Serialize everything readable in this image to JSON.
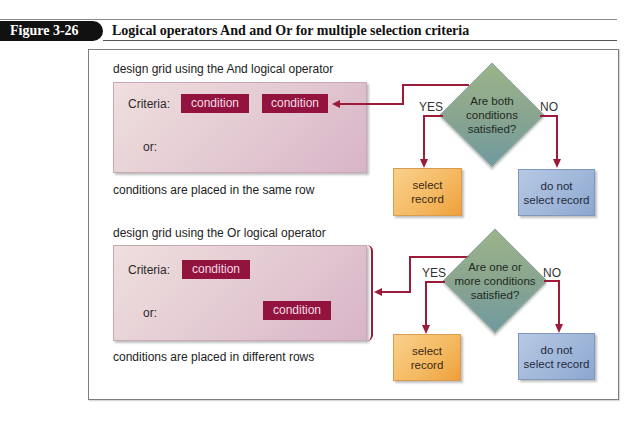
{
  "header": {
    "figure_label": "Figure 3-26",
    "title": "Logical operators And and Or for multiple selection criteria"
  },
  "and_section": {
    "caption_top": "design grid using the And logical operator",
    "criteria_label": "Criteria:",
    "or_label": "or:",
    "conditions": [
      "condition",
      "condition"
    ],
    "caption_bottom": "conditions are placed in the same row",
    "decision": "Are both conditions satisfied?",
    "decision_lines": [
      "Are both",
      "conditions",
      "satisfied?"
    ],
    "yes_label": "YES",
    "no_label": "NO",
    "yes_outcome_lines": [
      "select",
      "record"
    ],
    "no_outcome_lines": [
      "do not",
      "select record"
    ]
  },
  "or_section": {
    "caption_top": "design grid using the Or logical operator",
    "criteria_label": "Criteria:",
    "or_label": "or:",
    "conditions": [
      "condition",
      "condition"
    ],
    "caption_bottom": "conditions are placed in different rows",
    "decision": "Are one or more conditions satisfied?",
    "decision_lines": [
      "Are one or",
      "more conditions",
      "satisfied?"
    ],
    "yes_label": "YES",
    "no_label": "NO",
    "yes_outcome_lines": [
      "select",
      "record"
    ],
    "no_outcome_lines": [
      "do not",
      "select record"
    ]
  },
  "colors": {
    "condition_fill": "#93133f",
    "connector": "#9a1c39",
    "grid_fill": "#e4cbd3",
    "decision_fill": "#8aa58f",
    "select_fill": "#f4b860",
    "noselect_fill": "#9fb6d9"
  }
}
